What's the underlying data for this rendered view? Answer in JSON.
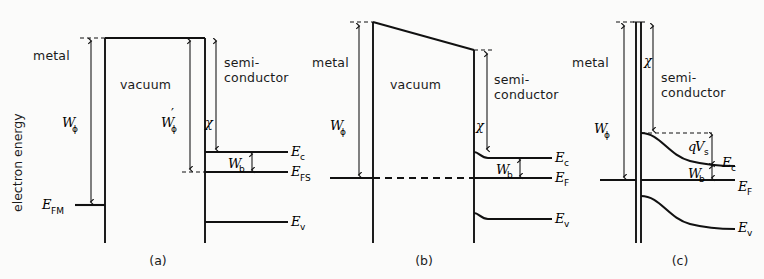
{
  "figure": {
    "axis_label": "electron energy",
    "panels": [
      {
        "caption": "(a)",
        "regions": {
          "metal": "metal",
          "vacuum": "vacuum",
          "semiconductor_line1": "semi-",
          "semiconductor_line2": "conductor"
        },
        "symbols": {
          "work_function": "W",
          "work_function_sub": "ϕ",
          "work_function_prime": "W",
          "work_function_prime_sub": "ϕ",
          "work_function_prime_mark": "′",
          "electron_affinity": "χ",
          "barrier": "W",
          "barrier_sub": "b",
          "fermi_metal": "E",
          "fermi_metal_sub": "FM",
          "conduction": "E",
          "conduction_sub": "c",
          "fermi_semiconductor": "E",
          "fermi_semiconductor_sub": "FS",
          "valence": "E",
          "valence_sub": "v"
        }
      },
      {
        "caption": "(b)",
        "regions": {
          "metal": "metal",
          "vacuum": "vacuum",
          "semiconductor_line1": "semi-",
          "semiconductor_line2": "conductor"
        },
        "symbols": {
          "work_function": "W",
          "work_function_sub": "ϕ",
          "electron_affinity": "χ",
          "barrier": "W",
          "barrier_sub": "b",
          "conduction": "E",
          "conduction_sub": "c",
          "fermi": "E",
          "fermi_sub": "F",
          "valence": "E",
          "valence_sub": "v"
        }
      },
      {
        "caption": "(c)",
        "regions": {
          "metal": "metal",
          "semiconductor_line1": "semi-",
          "semiconductor_line2": "conductor"
        },
        "symbols": {
          "work_function": "W",
          "work_function_sub": "ϕ",
          "electron_affinity": "χ",
          "surface_potential_q": "q",
          "surface_potential_V": "V",
          "surface_potential_sub": "s",
          "barrier": "W",
          "barrier_sub": "b",
          "conduction": "E",
          "conduction_sub": "c",
          "fermi": "E",
          "fermi_sub": "F",
          "valence": "E",
          "valence_sub": "v"
        }
      }
    ],
    "colors": {
      "ink": "#111111",
      "background": "#fbfbfa"
    }
  }
}
